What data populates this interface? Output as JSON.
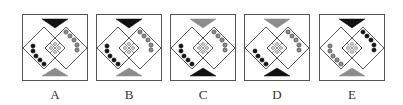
{
  "colors": {
    "black": "#111111",
    "gray": "#8c8c8c",
    "line": "#444444",
    "frame": "#555555"
  },
  "options": [
    {
      "label": "A",
      "top_triangle": "black",
      "bottom_triangle": "gray",
      "left_dots": {
        "count": 5,
        "fill": "black"
      },
      "right_dots": {
        "count": 5,
        "fill": "gray"
      }
    },
    {
      "label": "B",
      "top_triangle": "black",
      "bottom_triangle": "gray",
      "left_dots": {
        "count": 5,
        "fill": "black"
      },
      "right_dots": {
        "count": 5,
        "fill": "gray"
      }
    },
    {
      "label": "C",
      "top_triangle": "gray",
      "bottom_triangle": "black",
      "left_dots": {
        "count": 5,
        "fill": "black"
      },
      "right_dots": {
        "count": 5,
        "fill": "gray"
      }
    },
    {
      "label": "D",
      "top_triangle": "gray",
      "bottom_triangle": "black",
      "left_dots": {
        "count": 4,
        "fill": "black"
      },
      "right_dots": {
        "count": 5,
        "fill": "gray"
      }
    },
    {
      "label": "E",
      "top_triangle": "black",
      "bottom_triangle": "gray",
      "left_dots": {
        "count": 5,
        "fill": "gray"
      },
      "right_dots": {
        "count": 5,
        "fill": "black"
      }
    }
  ]
}
